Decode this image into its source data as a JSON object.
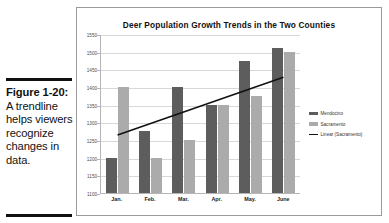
{
  "caption": {
    "figure_label": "Figure 1-20:",
    "text": " A trendline helps viewers recognize changes in data."
  },
  "chart_data": {
    "type": "bar",
    "title": "Deer Population Growth Trends in the Two Counties",
    "xlabel": "",
    "ylabel": "",
    "categories": [
      "Jan.",
      "Feb.",
      "Mar.",
      "Apr.",
      "May.",
      "June"
    ],
    "series": [
      {
        "name": "Mendocino",
        "values": [
          1200,
          1275,
          1400,
          1350,
          1475,
          1510
        ],
        "color": "#5d5d5d"
      },
      {
        "name": "Sacramento",
        "values": [
          1400,
          1200,
          1250,
          1350,
          1375,
          1500
        ],
        "color": "#ababab"
      }
    ],
    "trendline": {
      "name": "Linear (Sacramento)",
      "color": "#111111",
      "start_value": 1265,
      "end_value": 1430
    },
    "ylim": [
      1100,
      1550
    ],
    "yticks": [
      1550,
      1500,
      1450,
      1400,
      1350,
      1300,
      1250,
      1200,
      1150,
      1100
    ],
    "grid": true,
    "legend_position": "right",
    "legend_entries": [
      "Mendocino",
      "Sacramento",
      "Linear (Sacramento)"
    ]
  }
}
